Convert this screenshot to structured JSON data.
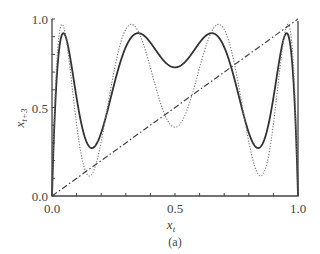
{
  "chart_data": {
    "type": "line",
    "title": "",
    "caption": "(a)",
    "xlabel": "x_t",
    "ylabel": "x_{t+3}",
    "xlim": [
      0.0,
      1.0
    ],
    "ylim": [
      0.0,
      1.0
    ],
    "x_ticks": [
      0.0,
      0.5,
      1.0
    ],
    "x_tick_labels": [
      "0.0",
      "0.5",
      "1.0"
    ],
    "x_minor_ticks": [
      0.1,
      0.2,
      0.3,
      0.4,
      0.6,
      0.7,
      0.8,
      0.9
    ],
    "y_ticks": [
      0.0,
      0.5,
      1.0
    ],
    "y_tick_labels": [
      "0.0",
      "0.5",
      "1.0"
    ],
    "y_minor_ticks": [
      0.1,
      0.2,
      0.3,
      0.4,
      0.6,
      0.7,
      0.8,
      0.9
    ],
    "grid": false,
    "legend": null,
    "series": [
      {
        "name": "third iterate (solid)",
        "style": "solid",
        "map": "logistic",
        "r": 3.68,
        "iterations": 3,
        "key_points": {
          "peaks": [
            [
              0.04,
              0.92
            ],
            [
              0.35,
              0.92
            ],
            [
              0.65,
              0.92
            ],
            [
              0.96,
              0.92
            ]
          ],
          "minima": [
            [
              0.16,
              0.25
            ],
            [
              0.5,
              0.7
            ],
            [
              0.84,
              0.25
            ]
          ]
        }
      },
      {
        "name": "third iterate (dotted)",
        "style": "dotted",
        "map": "logistic",
        "r": 3.88,
        "iterations": 3,
        "key_points": {
          "peaks": [
            [
              0.03,
              0.97
            ],
            [
              0.32,
              0.97
            ],
            [
              0.68,
              0.97
            ],
            [
              0.97,
              0.97
            ]
          ],
          "minima": [
            [
              0.15,
              0.1
            ],
            [
              0.5,
              0.33
            ],
            [
              0.85,
              0.1
            ]
          ]
        }
      },
      {
        "name": "identity line x_{t+3} = x_t",
        "style": "dashdot",
        "x": [
          0.0,
          1.0
        ],
        "y": [
          0.0,
          1.0
        ]
      }
    ]
  },
  "labels": {
    "x_axis": "x",
    "x_axis_sub": "t",
    "y_axis": "x",
    "y_axis_sub": "t+3",
    "caption": "(a)"
  },
  "colors": {
    "axis": "#444444",
    "solid": "#333333",
    "dotted": "#777777",
    "dashdot": "#444444"
  }
}
